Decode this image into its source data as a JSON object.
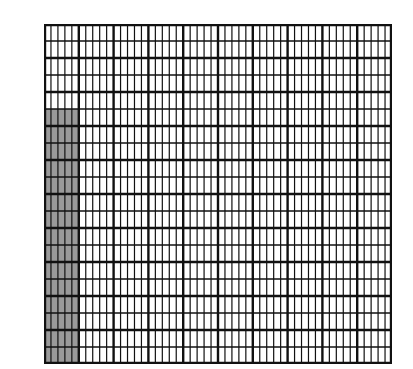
{
  "figure": {
    "major_columns": 10,
    "major_rows": 10,
    "sub_columns_per_major": 5,
    "sub_rows_per_major": 2,
    "total_small_cells": 1000,
    "shaded": {
      "major_column_index": 0,
      "start_sub_row": 5,
      "end_sub_row": 20,
      "shaded_small_cells": 75
    },
    "colors": {
      "background": "#ffffff",
      "line": "#111111",
      "shade": "#9a9a9a"
    }
  }
}
